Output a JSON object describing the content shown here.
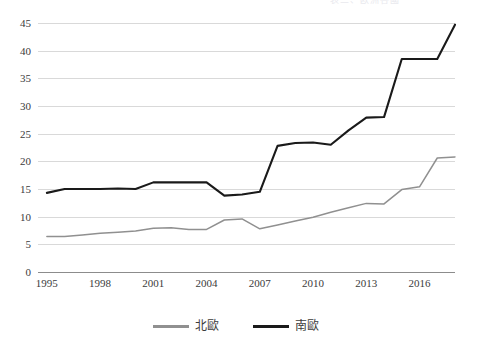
{
  "title_remnant": "表三、欧洲各國",
  "legend": {
    "position": "bottom-center",
    "items": [
      {
        "label": "北歐",
        "color": "#909090",
        "series": "north_europe"
      },
      {
        "label": "南歐",
        "color": "#1a1a1a",
        "series": "south_europe"
      }
    ]
  },
  "axes": {
    "y_ticks": [
      "0",
      "5",
      "10",
      "15",
      "20",
      "25",
      "30",
      "35",
      "40",
      "45"
    ],
    "x_ticks": [
      "1995",
      "1998",
      "2001",
      "2004",
      "2007",
      "2010",
      "2013",
      "2016"
    ]
  },
  "chart_data": {
    "type": "line",
    "title": "",
    "subtitle": "",
    "xlabel": "",
    "ylabel": "",
    "xlim": [
      1994.5,
      2018.0
    ],
    "ylim": [
      0,
      45
    ],
    "y_ticks": [
      0,
      5,
      10,
      15,
      20,
      25,
      30,
      35,
      40,
      45
    ],
    "x_ticks": [
      1995,
      1998,
      2001,
      2004,
      2007,
      2010,
      2013,
      2016
    ],
    "grid": "horizontal",
    "legend_position": "bottom-center",
    "x": [
      1995,
      1996,
      1997,
      1998,
      1999,
      2000,
      2001,
      2002,
      2003,
      2004,
      2005,
      2006,
      2007,
      2008,
      2009,
      2010,
      2011,
      2012,
      2013,
      2014,
      2015,
      2016,
      2017,
      2018
    ],
    "series": [
      {
        "name": "北歐",
        "color": "#909090",
        "values": [
          6.4,
          6.4,
          6.7,
          7.0,
          7.2,
          7.4,
          7.9,
          8.0,
          7.7,
          7.7,
          9.4,
          9.6,
          7.8,
          8.5,
          9.2,
          9.9,
          10.8,
          11.6,
          12.4,
          12.3,
          14.9,
          15.4,
          20.6,
          20.8
        ]
      },
      {
        "name": "南歐",
        "color": "#1a1a1a",
        "values": [
          14.3,
          15.0,
          15.0,
          15.0,
          15.1,
          15.0,
          16.2,
          16.2,
          16.2,
          16.2,
          13.8,
          14.0,
          14.5,
          22.8,
          23.3,
          23.4,
          23.0,
          25.6,
          27.9,
          28.0,
          38.5,
          38.5,
          38.5,
          44.7
        ]
      }
    ]
  }
}
